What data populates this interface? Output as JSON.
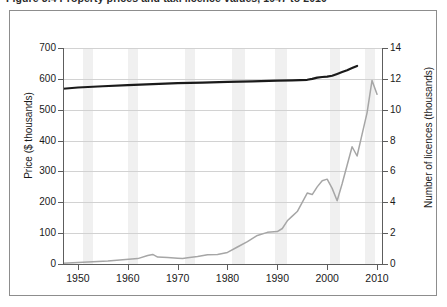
{
  "caption": {
    "text": "Figure 3.4   Property prices and taxi licence values, 1947 to 2010"
  },
  "chart_data": {
    "type": "line",
    "title": "",
    "xlabel": "",
    "ylabel": "Price ($ thousands)",
    "y2label": "Number of licences (thousands)",
    "xlim": [
      1947,
      2011
    ],
    "ylim": [
      0,
      700
    ],
    "y2lim": [
      0,
      14
    ],
    "xticks": [
      1950,
      1960,
      1970,
      1980,
      1990,
      2000,
      2010
    ],
    "yticks": [
      0,
      100,
      200,
      300,
      400,
      500,
      600,
      700
    ],
    "y2ticks": [
      0,
      2,
      4,
      6,
      8,
      10,
      12,
      14
    ],
    "grid": "horizontal",
    "legend": "none",
    "shaded_bands_label": "recession-shading",
    "shaded_bands": [
      [
        1951.0,
        1953.0
      ],
      [
        1960.0,
        1962.0
      ],
      [
        1971.5,
        1973.5
      ],
      [
        1981.0,
        1983.5
      ],
      [
        1989.5,
        1992.0
      ],
      [
        2000.5,
        2002.5
      ],
      [
        2007.5,
        2009.5
      ]
    ],
    "series": [
      {
        "name": "Price ($ thousands)",
        "axis": "left",
        "color": "#1a1a1a",
        "x": [
          1947,
          1950,
          1955,
          1960,
          1965,
          1970,
          1975,
          1980,
          1985,
          1990,
          1993,
          1996,
          1997,
          1998,
          1999,
          2000,
          2001,
          2002,
          2003,
          2004,
          2005,
          2006
        ],
        "values": [
          568,
          572,
          576,
          580,
          583,
          586,
          588,
          590,
          592,
          594,
          595,
          597,
          600,
          604,
          606,
          607,
          610,
          616,
          622,
          628,
          635,
          642
        ]
      },
      {
        "name": "Number of licences (thousands)",
        "axis": "right",
        "color": "#a6a6a6",
        "x": [
          1947,
          1950,
          1953,
          1956,
          1959,
          1962,
          1964,
          1965,
          1966,
          1968,
          1970,
          1971,
          1972,
          1974,
          1976,
          1978,
          1980,
          1982,
          1984,
          1986,
          1988,
          1990,
          1991,
          1992,
          1993,
          1994,
          1995,
          1996,
          1997,
          1998,
          1999,
          2000,
          2001,
          2002,
          2003,
          2004,
          2005,
          2006,
          2007,
          2008,
          2009,
          2010
        ],
        "values": [
          0.05,
          0.1,
          0.15,
          0.2,
          0.28,
          0.35,
          0.55,
          0.62,
          0.45,
          0.42,
          0.38,
          0.36,
          0.4,
          0.48,
          0.6,
          0.62,
          0.75,
          1.1,
          1.45,
          1.85,
          2.05,
          2.1,
          2.3,
          2.8,
          3.1,
          3.4,
          4.0,
          4.6,
          4.5,
          5.0,
          5.4,
          5.5,
          4.9,
          4.1,
          5.2,
          6.4,
          7.6,
          7.0,
          8.4,
          9.8,
          11.9,
          11.0
        ]
      }
    ]
  }
}
